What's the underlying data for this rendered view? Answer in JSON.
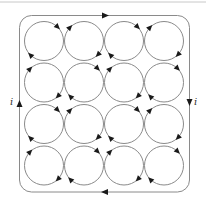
{
  "figure": {
    "colors": {
      "line": "#8a8a8a",
      "arrow": "#1a1a1a",
      "rule": "#bdbdbd"
    },
    "grid": {
      "rows": 4,
      "cols": 4,
      "direction": "clockwise"
    },
    "boundary_current": {
      "direction": "clockwise"
    },
    "labels": {
      "left_current": "i",
      "right_current": "i"
    }
  }
}
